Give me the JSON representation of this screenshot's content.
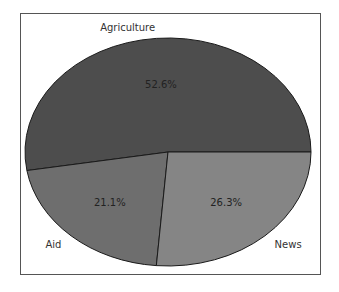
{
  "chart_data": {
    "type": "pie",
    "title": "",
    "categories": [
      "Agriculture",
      "Aid",
      "News"
    ],
    "values": [
      52.6,
      21.1,
      26.3
    ],
    "labels": [
      "52.6%",
      "21.1%",
      "26.3%"
    ],
    "colors": [
      "#4d4d4d",
      "#6e6e6e",
      "#858585"
    ],
    "start_angle_deg": 0,
    "direction": "counterclockwise",
    "legend": "none",
    "frame": true
  }
}
